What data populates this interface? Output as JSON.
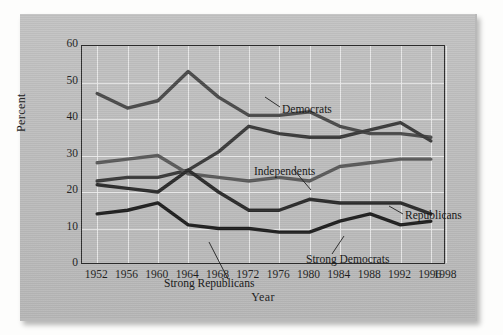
{
  "chart_data": {
    "type": "line",
    "title": "",
    "xlabel": "Year",
    "ylabel": "Percent",
    "xlim": [
      1950,
      1998
    ],
    "ylim": [
      0,
      60
    ],
    "grid": true,
    "legend_position": "inline-annotations",
    "xticks": [
      1952,
      1956,
      1960,
      1964,
      1968,
      1972,
      1976,
      1980,
      1984,
      1988,
      1992,
      1996,
      1998
    ],
    "yticks": [
      0,
      10,
      20,
      30,
      40,
      50,
      60
    ],
    "x": [
      1952,
      1956,
      1960,
      1964,
      1968,
      1972,
      1976,
      1980,
      1984,
      1988,
      1992,
      1996
    ],
    "series": [
      {
        "name": "Democrats",
        "color": "#4a4a4a",
        "values": [
          47,
          43,
          45,
          53,
          46,
          41,
          41,
          42,
          38,
          36,
          36,
          35
        ]
      },
      {
        "name": "Independents",
        "color": "#3a3a3a",
        "values": [
          23,
          24,
          24,
          26,
          31,
          38,
          36,
          35,
          35,
          37,
          39,
          34
        ]
      },
      {
        "name": "Republicans",
        "color": "#5a5a5a",
        "values": [
          28,
          29,
          30,
          25,
          24,
          23,
          24,
          23,
          27,
          28,
          29,
          29
        ]
      },
      {
        "name": "Strong Democrats",
        "color": "#2b2b2b",
        "values": [
          22,
          21,
          20,
          26,
          20,
          15,
          15,
          18,
          17,
          17,
          17,
          14
        ]
      },
      {
        "name": "Strong Republicans",
        "color": "#1f1f1f",
        "values": [
          14,
          15,
          17,
          11,
          10,
          10,
          9,
          9,
          12,
          14,
          11,
          12
        ]
      }
    ],
    "annotations": [
      {
        "label": "Democrats",
        "x": 200,
        "y": 57
      },
      {
        "label": "Independents",
        "x": 172,
        "y": 119
      },
      {
        "label": "Republicans",
        "x": 323,
        "y": 163
      },
      {
        "label": "Strong Democrats",
        "x": 224,
        "y": 207
      },
      {
        "label": "Strong Republicans",
        "x": 82,
        "y": 231
      }
    ]
  },
  "page": {
    "background_color": "#bdbdbd",
    "frame_color": "#2c2c2c",
    "grid_color": "#efefef"
  }
}
